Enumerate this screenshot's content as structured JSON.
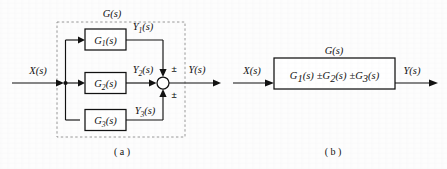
{
  "figure": {
    "type": "control-system-block-diagram",
    "background_color": "#fdfdfd",
    "line_color": "#111111",
    "dashed_border_color": "#8c8c8c"
  },
  "panel_a": {
    "caption": "( a )",
    "group_label": "G(s)",
    "input_label": "X(s)",
    "output_label": "Y(s)",
    "blocks": [
      {
        "label": "G",
        "subscript": "1",
        "suffix": "(s)",
        "full": "G1(s)",
        "output_label": "Y",
        "output_subscript": "1",
        "output_suffix": "(s)"
      },
      {
        "label": "G",
        "subscript": "2",
        "suffix": "(s)",
        "full": "G2(s)",
        "output_label": "Y",
        "output_subscript": "2",
        "output_suffix": "(s)"
      },
      {
        "label": "G",
        "subscript": "3",
        "suffix": "(s)",
        "full": "G3(s)",
        "output_label": "Y",
        "output_subscript": "3",
        "output_suffix": "(s)"
      }
    ],
    "summing_junction": {
      "name": "summing-junction",
      "sign_top": "±",
      "sign_bottom": "±"
    }
  },
  "panel_b": {
    "caption": "( b )",
    "group_label": "G(s)",
    "input_label": "X(s)",
    "output_label": "Y(s)",
    "block_expression": {
      "term1_base": "G",
      "term1_sub": "1",
      "term1_suffix": "(s)",
      "op1": "±",
      "term2_base": "G",
      "term2_sub": "2",
      "term2_suffix": "(s)",
      "op2": "±",
      "term3_base": "G",
      "term3_sub": "3",
      "term3_suffix": "(s)",
      "full": "G1(s) ± G2(s) ± G3(s)"
    }
  }
}
